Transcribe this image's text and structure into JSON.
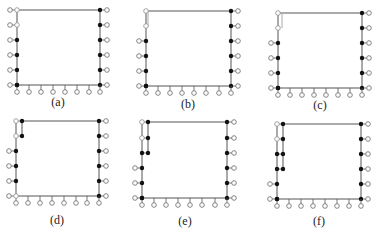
{
  "figure": {
    "colors": {
      "line": "#555555",
      "grey_line": "#aaaaaa",
      "filled_node": "#111111",
      "open_node_stroke": "#777777",
      "open_node_fill": "#ffffff"
    },
    "panels": [
      {
        "id": "a",
        "label": "(a)",
        "label_pos": [
          58,
          103
        ],
        "left_x": 17,
        "right_x": 100,
        "top_y": 10,
        "bottom_y": 85,
        "rows_y": [
          10,
          25,
          40,
          55,
          70,
          85
        ],
        "bottom_x": [
          17,
          29,
          41,
          53,
          65,
          77,
          89,
          100
        ],
        "left_nodes": [
          "open",
          "open",
          "filled",
          "filled",
          "filled",
          "filled"
        ],
        "top_left_grey": false,
        "second_col": null
      },
      {
        "id": "b",
        "label": "(b)",
        "label_pos": [
          188,
          105
        ],
        "left_x": 146,
        "right_x": 231,
        "top_y": 11,
        "bottom_y": 86,
        "rows_y": [
          11,
          26,
          41,
          56,
          71,
          86
        ],
        "bottom_x": [
          146,
          158,
          170,
          182,
          194,
          206,
          219,
          231
        ],
        "left_nodes": [
          "open",
          "open",
          "filled",
          "filled",
          "filled",
          "filled"
        ],
        "top_left_grey": true,
        "grey_stub": {
          "x_offset": 2,
          "rows": 2
        },
        "second_col": null
      },
      {
        "id": "c",
        "label": "(c)",
        "label_pos": [
          320,
          106
        ],
        "left_x": 278,
        "right_x": 362,
        "top_y": 13,
        "bottom_y": 88,
        "rows_y": [
          13,
          28,
          43,
          58,
          73,
          88
        ],
        "bottom_x": [
          278,
          290,
          302,
          314,
          326,
          338,
          350,
          362
        ],
        "left_nodes": [
          "open",
          "open",
          "filled",
          "filled",
          "filled",
          "filled"
        ],
        "top_left_grey": true,
        "grey_stub": {
          "x_offset": 4,
          "rows": 2
        },
        "second_col": null
      },
      {
        "id": "d",
        "label": "(d)",
        "label_pos": [
          57,
          221
        ],
        "left_x": 16,
        "right_x": 99,
        "top_y": 121,
        "bottom_y": 196,
        "rows_y": [
          121,
          136,
          151,
          166,
          181,
          196
        ],
        "bottom_x": [
          16,
          28,
          40,
          52,
          64,
          76,
          87,
          99
        ],
        "left_nodes": [
          "open",
          "open",
          "filled",
          "filled",
          "filled",
          "open"
        ],
        "top_left_grey": false,
        "second_col": {
          "x": 22,
          "rows": 2
        }
      },
      {
        "id": "e",
        "label": "(e)",
        "label_pos": [
          185,
          222
        ],
        "left_x": 142,
        "right_x": 227,
        "top_y": 122,
        "bottom_y": 198,
        "rows_y": [
          122,
          138,
          153,
          168,
          183,
          198
        ],
        "bottom_x": [
          142,
          154,
          166,
          178,
          190,
          202,
          215,
          227
        ],
        "left_nodes": [
          "open",
          "open",
          "filled",
          "filled",
          "filled",
          "filled"
        ],
        "top_left_grey": false,
        "second_col": {
          "x": 148,
          "rows": 3
        }
      },
      {
        "id": "f",
        "label": "(f)",
        "label_pos": [
          319,
          222
        ],
        "left_x": 277,
        "right_x": 361,
        "top_y": 124,
        "bottom_y": 199,
        "rows_y": [
          124,
          139,
          154,
          169,
          184,
          199
        ],
        "bottom_x": [
          277,
          289,
          301,
          313,
          325,
          337,
          349,
          361
        ],
        "left_nodes": [
          "open",
          "open",
          "filled",
          "filled",
          "filled",
          "filled"
        ],
        "top_left_grey": false,
        "second_col": {
          "x": 283,
          "rows": 4
        }
      }
    ]
  }
}
